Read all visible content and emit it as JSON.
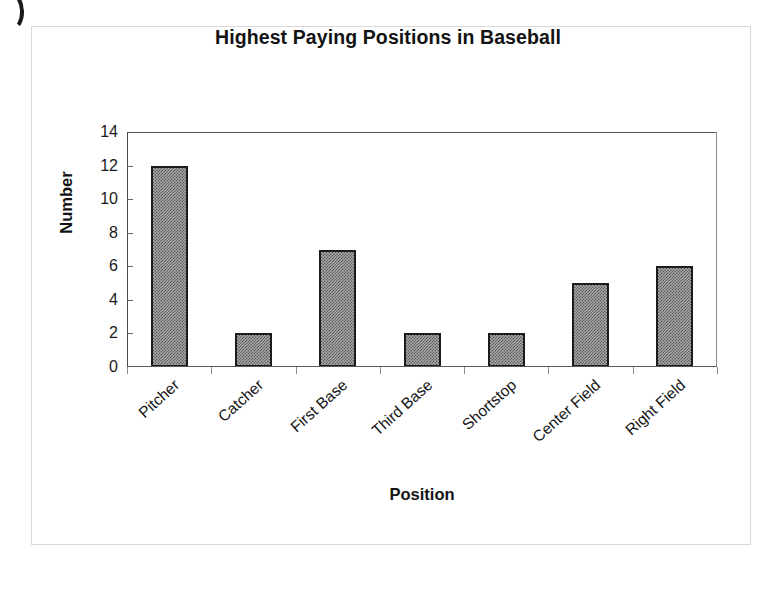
{
  "page": {
    "background_color": "#ffffff",
    "frame_color": "#d9d9d9",
    "corner_mark": ")"
  },
  "chart_data": {
    "type": "bar",
    "title": "Highest Paying Positions in Baseball",
    "xlabel": "Position",
    "ylabel": "Number",
    "categories": [
      "Pitcher",
      "Catcher",
      "First Base",
      "Third Base",
      "Shortstop",
      "Center Field",
      "Right Field"
    ],
    "values": [
      12,
      2,
      7,
      2,
      2,
      5,
      6
    ],
    "ylim": [
      0,
      14
    ],
    "ytick_values": [
      0,
      2,
      4,
      6,
      8,
      10,
      12,
      14
    ],
    "ytick_labels": [
      "0",
      "2",
      "4",
      "6",
      "8",
      "10",
      "12",
      "14"
    ],
    "grid": false,
    "legend": false,
    "bar_fill_color": "#a6a6a6",
    "bar_border_color": "#1c1c1c",
    "axis_color": "#555555",
    "text_color": "#131313",
    "xlabel_rotation_degrees": -42,
    "series": [
      {
        "name": "Number",
        "values": [
          12,
          2,
          7,
          2,
          2,
          5,
          6
        ]
      }
    ]
  }
}
